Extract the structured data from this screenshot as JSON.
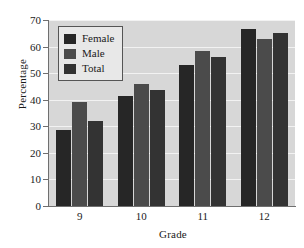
{
  "chart_data": {
    "type": "bar",
    "title": "",
    "xlabel": "Grade",
    "ylabel": "Percentage",
    "categories": [
      "9",
      "10",
      "11",
      "12"
    ],
    "series": [
      {
        "name": "Female",
        "values": [
          28.5,
          41.5,
          53.0,
          66.5
        ],
        "color": "#262626"
      },
      {
        "name": "Male",
        "values": [
          39.0,
          46.0,
          58.5,
          63.0
        ],
        "color": "#4b4b4b"
      },
      {
        "name": "Total",
        "values": [
          32.0,
          43.5,
          56.0,
          65.0
        ],
        "color": "#333333"
      }
    ],
    "ylim": [
      0,
      70
    ],
    "yticks": [
      0,
      10,
      20,
      30,
      40,
      50,
      60,
      70
    ],
    "ytick_labels": [
      "0",
      "10",
      "20",
      "30",
      "40",
      "50",
      "60",
      "70"
    ],
    "grid": true,
    "grid_color": "#f2f2f2",
    "plot_background": "#d7d7d7",
    "figure_background": "#ffffff",
    "legend": {
      "position": "upper-left",
      "entries": [
        {
          "label": "Female",
          "color": "#262626"
        },
        {
          "label": "Male",
          "color": "#4b4b4b"
        },
        {
          "label": "Total",
          "color": "#333333"
        }
      ]
    }
  }
}
